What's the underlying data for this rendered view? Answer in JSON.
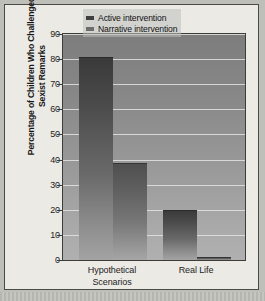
{
  "chart_data": {
    "type": "bar",
    "title": "",
    "xlabel": "",
    "ylabel": "Percentage of Children Who Challenged Sexist Remarks",
    "ylabel_line1": "Percentage of Children Who Challenged",
    "ylabel_line2": "Sexist Remarks",
    "categories": [
      "Hypothetical Scenarios",
      "Real Life"
    ],
    "category_labels": [
      {
        "line1": "Hypothetical",
        "line2": "Scenarios"
      },
      {
        "line1": "Real Life",
        "line2": ""
      }
    ],
    "series": [
      {
        "name": "Active intervention",
        "values": [
          81,
          20
        ],
        "color": "#3f3f3f"
      },
      {
        "name": "Narrative intervention",
        "values": [
          38.5,
          1
        ],
        "color": "#6d6d6d"
      }
    ],
    "ylim": [
      0,
      90
    ],
    "ytick_step": 10,
    "yticks": [
      0,
      10,
      20,
      30,
      40,
      50,
      60,
      70,
      80,
      90
    ],
    "ytick_labels": [
      "0",
      "10",
      "20",
      "30",
      "40",
      "50",
      "60",
      "70",
      "80",
      "90"
    ],
    "grid": true,
    "grid_axis": "y",
    "legend_position": "top-right",
    "legend": [
      "Active intervention",
      "Narrative intervention"
    ],
    "background_color": "#9b9b9b",
    "page_color": "#eceae5"
  }
}
